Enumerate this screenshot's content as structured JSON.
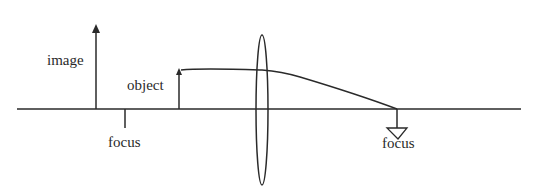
{
  "diagram": {
    "type": "optics-ray-diagram",
    "labels": {
      "image": "image",
      "object": "object",
      "focus_left": "focus",
      "focus_right": "focus"
    },
    "colors": {
      "line": "#2a2a2a",
      "background": "#ffffff"
    }
  }
}
